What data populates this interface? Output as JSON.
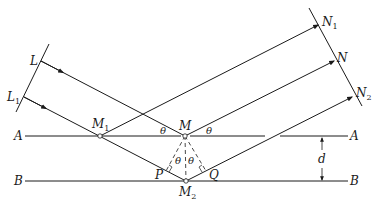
{
  "figure": {
    "labels": {
      "L": "L",
      "L1_main": "L",
      "L1_sub": "1",
      "N1_main": "N",
      "N1_sub": "1",
      "N": "N",
      "N2_main": "N",
      "N2_sub": "2",
      "M1_main": "M",
      "M1_sub": "1",
      "M": "M",
      "M2_main": "M",
      "M2_sub": "2",
      "A_left": "A",
      "A_right": "A",
      "B_left": "B",
      "B_right": "B",
      "P": "P",
      "Q": "Q",
      "d": "d",
      "theta": "θ"
    },
    "planes": [
      {
        "name": "A",
        "y": 136
      },
      {
        "name": "B",
        "y": 181
      }
    ],
    "points": {
      "M1": [
        100,
        136
      ],
      "M": [
        185,
        136
      ],
      "M2": [
        186,
        181
      ],
      "P": [
        166,
        170
      ],
      "Q": [
        206,
        170
      ]
    },
    "colors": {
      "line": "#1a1a1a",
      "background": "#ffffff"
    }
  }
}
